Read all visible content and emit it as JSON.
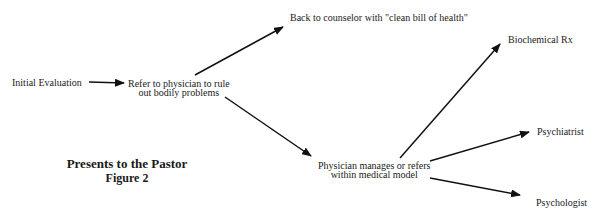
{
  "title": "Presents to the Pastor",
  "subtitle": "Figure 2",
  "nodes": {
    "initial": "Initial Evaluation",
    "refer_line1": "Refer to physician to rule",
    "refer_line2": "out bodily problems",
    "back": "Back to counselor with \"clean bill of health\"",
    "manages_line1": "Physician manages or refers",
    "manages_line2": "within medical model",
    "biochem": "Biochemical Rx",
    "psychiatrist": "Psychiatrist",
    "psychologist": "Psychologist"
  },
  "edges": [
    {
      "from": "Initial Evaluation",
      "to": "Refer to physician to rule out bodily problems"
    },
    {
      "from": "Refer to physician to rule out bodily problems",
      "to": "Back to counselor with \"clean bill of health\""
    },
    {
      "from": "Refer to physician to rule out bodily problems",
      "to": "Physician manages or refers within medical model"
    },
    {
      "from": "Physician manages or refers within medical model",
      "to": "Biochemical Rx"
    },
    {
      "from": "Physician manages or refers within medical model",
      "to": "Psychiatrist"
    },
    {
      "from": "Physician manages or refers within medical model",
      "to": "Psychologist"
    }
  ]
}
